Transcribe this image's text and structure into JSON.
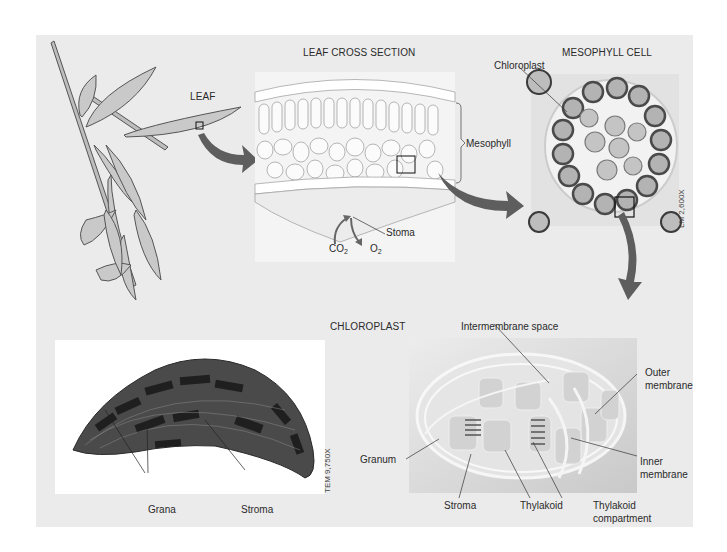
{
  "figure": {
    "panels": {
      "leaf": {
        "title": "LEAF"
      },
      "cross_section": {
        "title": "LEAF CROSS SECTION",
        "labels": {
          "mesophyll": "Mesophyll",
          "stoma": "Stoma",
          "co2": "CO",
          "co2_sub": "2",
          "o2": "O",
          "o2_sub": "2"
        }
      },
      "mesophyll_cell": {
        "title": "MESOPHYLL CELL",
        "labels": {
          "chloroplast": "Chloroplast"
        },
        "magnification": "LM 2,600X"
      },
      "chloroplast_tem": {
        "labels": {
          "grana": "Grana",
          "stroma": "Stroma"
        },
        "magnification": "TEM 9,750X"
      },
      "chloroplast_diagram": {
        "title": "CHLOROPLAST",
        "labels": {
          "intermembrane_space": "Intermembrane space",
          "outer_membrane_1": "Outer",
          "outer_membrane_2": "membrane",
          "granum": "Granum",
          "inner_membrane_1": "Inner",
          "inner_membrane_2": "membrane",
          "stroma": "Stroma",
          "thylakoid": "Thylakoid",
          "thylakoid_compartment_1": "Thylakoid",
          "thylakoid_compartment_2": "compartment"
        }
      }
    },
    "colors": {
      "panel_bg": "#ebebeb",
      "arrow": "#5e5e5e",
      "leaf_fill": "#c9c9c9",
      "line": "#333333"
    }
  }
}
